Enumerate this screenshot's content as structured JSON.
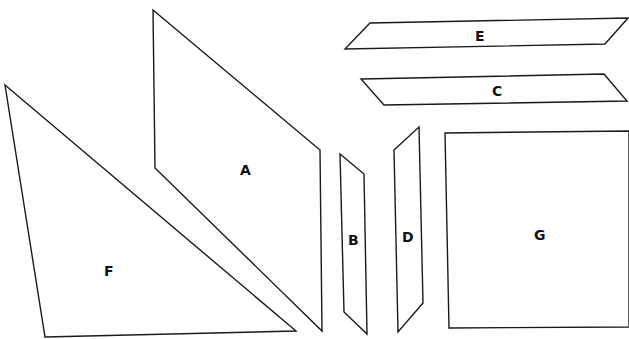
{
  "diagram": {
    "shapes": [
      {
        "id": "A",
        "label": "A",
        "type": "parallelogram",
        "points": "153,10 320,150 322,331 155,168",
        "label_pos": [
          246,
          174
        ]
      },
      {
        "id": "B",
        "label": "B",
        "type": "parallelogram",
        "points": "340,154 364,174 367,334 344,312",
        "label_pos": [
          354,
          240
        ]
      },
      {
        "id": "C",
        "label": "C",
        "type": "parallelogram",
        "points": "361,79 604,74 627,101 384,105",
        "label_pos": [
          498,
          93
        ]
      },
      {
        "id": "D",
        "label": "D",
        "type": "parallelogram",
        "points": "394,150 419,127 423,303 398,332",
        "label_pos": [
          408,
          240
        ]
      },
      {
        "id": "E",
        "label": "E",
        "type": "parallelogram",
        "points": "345,49 370,23 628,18 605,44",
        "label_pos": [
          480,
          40
        ]
      },
      {
        "id": "F",
        "label": "F",
        "type": "triangle",
        "points": "5,85 296,331 45,337",
        "label_pos": [
          110,
          274
        ]
      },
      {
        "id": "G",
        "label": "G",
        "type": "square",
        "points": "445,133 629,131 629,327 449,328",
        "label_pos": [
          540,
          238
        ]
      }
    ]
  }
}
